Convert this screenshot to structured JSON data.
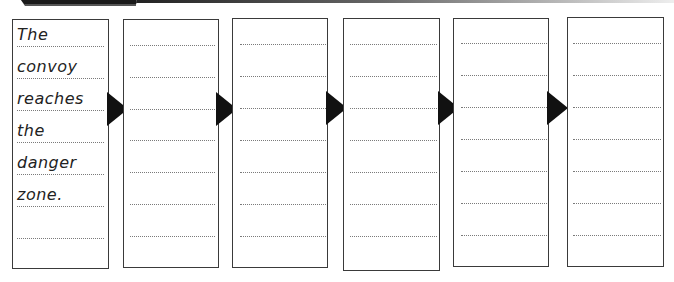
{
  "header": {
    "banner_color": "#1a1a1a",
    "rule_gradient": [
      "#222222",
      "#eeeeee"
    ]
  },
  "storyboard": {
    "line_color": "#7a7a7a",
    "border_color": "#3a3a3a",
    "arrow_color": "#111111",
    "frames": [
      {
        "index": 1,
        "words": [
          "The",
          "convoy",
          "reaches",
          "the",
          "danger",
          "zone.",
          ""
        ],
        "line_count": 7
      },
      {
        "index": 2,
        "words": [
          "",
          "",
          "",
          "",
          "",
          "",
          ""
        ],
        "line_count": 7
      },
      {
        "index": 3,
        "words": [
          "",
          "",
          "",
          "",
          "",
          "",
          ""
        ],
        "line_count": 7
      },
      {
        "index": 4,
        "words": [
          "",
          "",
          "",
          "",
          "",
          "",
          ""
        ],
        "line_count": 7
      },
      {
        "index": 5,
        "words": [
          "",
          "",
          "",
          "",
          "",
          "",
          ""
        ],
        "line_count": 7
      },
      {
        "index": 6,
        "words": [
          "",
          "",
          "",
          "",
          "",
          "",
          ""
        ],
        "line_count": 7
      }
    ],
    "arrow_count": 5,
    "arrow_icon": "right-triangle-arrow-icon"
  }
}
